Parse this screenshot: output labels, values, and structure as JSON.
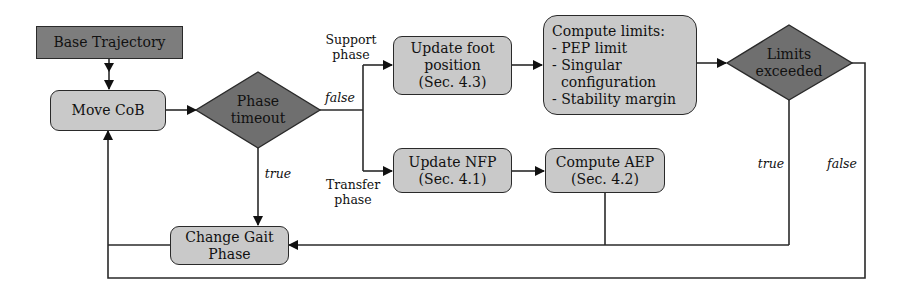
{
  "diagram": {
    "nodes": {
      "base_trajectory": {
        "label": "Base Trajectory"
      },
      "move_cob": {
        "label": "Move CoB"
      },
      "phase_timeout": {
        "line1": "Phase",
        "line2": "timeout"
      },
      "update_foot": {
        "line1": "Update foot",
        "line2": "position",
        "line3": "(Sec. 4.3)"
      },
      "compute_limits": {
        "title": "Compute limits:",
        "items": [
          "- PEP limit",
          "- Singular",
          "  configuration",
          "- Stability margin"
        ]
      },
      "limits_exceeded": {
        "line1": "Limits",
        "line2": "exceeded"
      },
      "update_nfp": {
        "line1": "Update NFP",
        "line2": "(Sec. 4.1)"
      },
      "compute_aep": {
        "line1": "Compute AEP",
        "line2": "(Sec. 4.2)"
      },
      "change_gait_phase": {
        "label": "Change Gait Phase"
      }
    },
    "edge_labels": {
      "support_phase": {
        "line1": "Support",
        "line2": "phase"
      },
      "transfer_phase": {
        "line1": "Transfer",
        "line2": "phase"
      },
      "timeout_false": "false",
      "timeout_true": "true",
      "limits_true": "true",
      "limits_false": "false"
    },
    "colors": {
      "decision_fill": "#6f6f6f",
      "process_fill": "#c9c9c9",
      "start_fill": "#7d7d7d",
      "line": "#2a2a2a"
    }
  }
}
